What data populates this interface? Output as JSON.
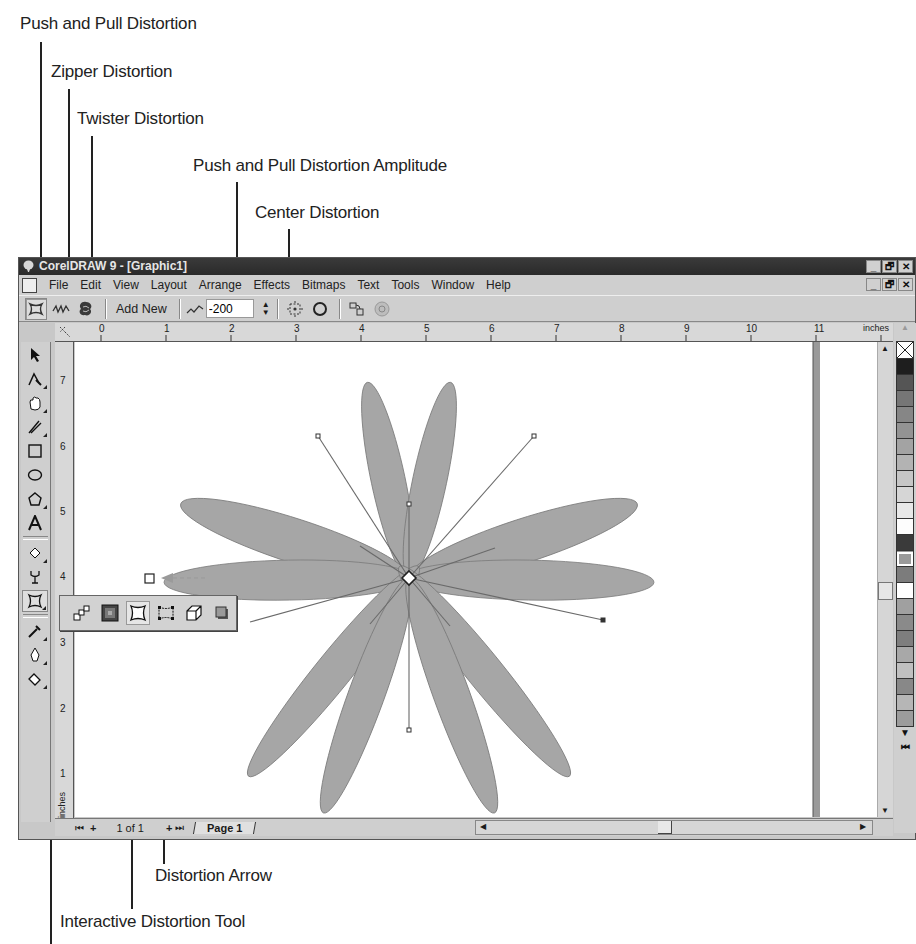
{
  "callouts": {
    "push_pull": "Push and Pull Distortion",
    "zipper": "Zipper Distortion",
    "twister": "Twister Distortion",
    "amplitude": "Push and Pull Distortion Amplitude",
    "center": "Center Distortion",
    "arrow": "Distortion Arrow",
    "tool": "Interactive Distortion Tool"
  },
  "window": {
    "title": "CorelDRAW 9 - [Graphic1]",
    "controls": {
      "minimize": "_",
      "restore": "🗗",
      "close": "✕"
    }
  },
  "menubar": {
    "items": [
      {
        "label": "File",
        "hotkey": "F"
      },
      {
        "label": "Edit",
        "hotkey": "d"
      },
      {
        "label": "View",
        "hotkey": "V"
      },
      {
        "label": "Layout",
        "hotkey": "L"
      },
      {
        "label": "Arrange",
        "hotkey": "A"
      },
      {
        "label": "Effects",
        "hotkey": "c"
      },
      {
        "label": "Bitmaps",
        "hotkey": "B"
      },
      {
        "label": "Text",
        "hotkey": "T"
      },
      {
        "label": "Tools",
        "hotkey": "o"
      },
      {
        "label": "Window",
        "hotkey": "W"
      },
      {
        "label": "Help",
        "hotkey": "H"
      }
    ]
  },
  "property_bar": {
    "add_new_label": "Add New",
    "amplitude_value": "-200",
    "buttons": [
      "push-pull-distortion",
      "zipper-distortion",
      "twister-distortion",
      "add-new",
      "amplitude",
      "center-distortion",
      "convert-to-curves",
      "copy-distortion-properties",
      "clear-distortion"
    ]
  },
  "rulers": {
    "horizontal_unit": "inches",
    "vertical_unit": "inches",
    "horizontal_ticks": [
      "0",
      "1",
      "2",
      "3",
      "4",
      "5",
      "6",
      "7",
      "8",
      "9",
      "10",
      "11"
    ],
    "vertical_ticks": [
      "7",
      "6",
      "5",
      "4",
      "3",
      "2",
      "1"
    ]
  },
  "page_nav": {
    "counter": "1 of 1",
    "tab": "Page 1"
  },
  "palette": {
    "colors": [
      "#1e1e1e",
      "#555555",
      "#767676",
      "#868686",
      "#939393",
      "#a3a3a3",
      "#b3b3b3",
      "#c6c6c6",
      "#d6d6d6",
      "#e8e8e8",
      "#fdfdfd",
      "#3a3a3a",
      "#9a9a9a",
      "#7c7c7c",
      "#ffffff",
      "#a0a0a0",
      "#8a8a8a",
      "#7e7e7e",
      "#a8a8a8",
      "#c0c0c0",
      "#888888",
      "#b6b6b6",
      "#9c9c9c"
    ]
  },
  "colors": {
    "petal_fill": "#a6a6a6",
    "petal_stroke": "#7a7a7a",
    "titlebar": "#2f2f2f",
    "chrome": "#cfcfcf"
  }
}
